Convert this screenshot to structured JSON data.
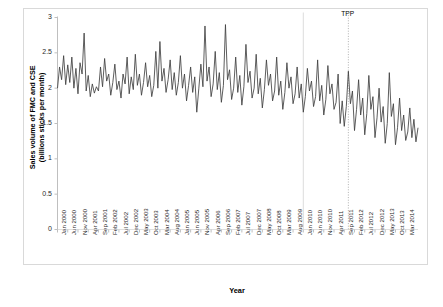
{
  "chart_data": {
    "type": "line",
    "title": "",
    "xlabel": "Year",
    "ylabel": "Sales volume of FMC and CSE (billions sticks per month)",
    "ylabel_line1": "Sales volume of FMC and CSE",
    "ylabel_line2": "(billions sticks per month)",
    "ylim": [
      0,
      3
    ],
    "yticks": [
      0,
      0.5,
      1,
      1.5,
      2,
      2.5,
      3
    ],
    "ytick_labels": [
      "0",
      "0.5",
      "1",
      "1.5",
      "2",
      "2.5",
      "3"
    ],
    "grid": false,
    "legend": "none",
    "line_color": "#404040",
    "annotations": [
      {
        "label": "TPP",
        "x_index": 142,
        "style": "dotted-vertical-line"
      },
      {
        "label": "",
        "x_index": 120,
        "style": "solid-vertical-line"
      }
    ],
    "xtick_interval_months": 5,
    "xtick_labels": [
      "Jan 2000",
      "Jun 2000",
      "Nov 2000",
      "Apr 2001",
      "Sep 2001",
      "Feb 2002",
      "Jul 2002",
      "Dec 2002",
      "May 2003",
      "Oct 2003",
      "Mar 2004",
      "Aug 2004",
      "Jan 2005",
      "Jun 2005",
      "Nov 2005",
      "Apr 2006",
      "Sep 2006",
      "Feb 2007",
      "Jul 2007",
      "Dec 2007",
      "May 2008",
      "Oct 2008",
      "Mar 2009",
      "Aug 2009",
      "Jan 2010",
      "Jun 2010",
      "Nov 2010",
      "Apr 2011",
      "Sep 2011",
      "Feb 2012",
      "Jul 2012",
      "Dec 2012",
      "May 2013",
      "Oct 2013",
      "Mar 2014"
    ],
    "x_start": "Jan 2000",
    "x_end": "Mar 2014",
    "values": [
      2.0,
      2.3,
      2.12,
      2.46,
      2.05,
      2.33,
      2.08,
      2.44,
      2.0,
      2.28,
      1.92,
      2.36,
      2.2,
      2.78,
      1.96,
      2.18,
      1.88,
      2.06,
      1.93,
      2.02,
      1.96,
      2.3,
      2.02,
      2.42,
      2.1,
      2.2,
      1.9,
      2.08,
      2.34,
      1.98,
      2.1,
      1.86,
      2.2,
      2.06,
      2.44,
      1.92,
      2.16,
      1.98,
      2.48,
      2.04,
      2.2,
      1.9,
      2.08,
      2.36,
      2.02,
      2.18,
      1.88,
      2.04,
      2.52,
      2.0,
      2.66,
      2.1,
      2.28,
      1.94,
      2.12,
      2.4,
      1.98,
      2.22,
      1.9,
      2.08,
      2.46,
      2.0,
      2.2,
      1.82,
      2.04,
      2.3,
      1.94,
      2.16,
      1.66,
      2.0,
      2.34,
      2.02,
      2.88,
      2.1,
      2.3,
      1.88,
      2.06,
      2.52,
      1.98,
      2.22,
      1.8,
      2.04,
      2.9,
      2.12,
      2.26,
      1.84,
      2.0,
      2.44,
      1.94,
      2.18,
      1.76,
      2.02,
      2.62,
      2.08,
      2.24,
      1.86,
      2.0,
      2.48,
      1.92,
      2.14,
      1.72,
      1.98,
      2.4,
      2.04,
      2.2,
      1.82,
      1.96,
      2.44,
      1.9,
      2.1,
      1.7,
      1.94,
      2.36,
      2.0,
      2.16,
      1.78,
      1.92,
      2.3,
      1.86,
      2.06,
      1.66,
      1.88,
      2.28,
      1.96,
      2.1,
      1.74,
      1.88,
      2.4,
      1.82,
      2.04,
      1.62,
      1.84,
      2.32,
      1.92,
      2.06,
      1.7,
      1.8,
      2.2,
      1.5,
      1.82,
      1.46,
      1.74,
      2.24,
      1.78,
      1.96,
      1.4,
      1.7,
      2.12,
      1.62,
      1.86,
      1.34,
      1.64,
      2.18,
      1.7,
      1.88,
      1.3,
      1.58,
      2.0,
      1.52,
      1.74,
      1.22,
      1.5,
      2.22,
      1.6,
      1.78,
      1.2,
      1.44,
      1.86,
      1.4,
      1.62,
      1.26,
      1.38,
      1.72,
      1.3,
      1.56,
      1.24,
      1.44
    ]
  }
}
